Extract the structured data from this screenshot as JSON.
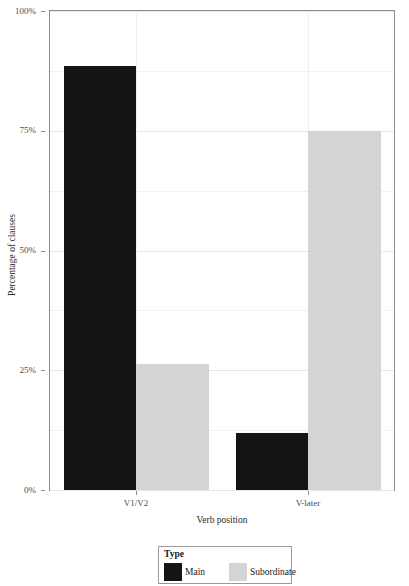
{
  "chart_data": {
    "type": "bar",
    "title": "",
    "subtitle": "",
    "xlabel": "Verb position",
    "ylabel": "Percentage of clauses",
    "categories": [
      "V1/V2",
      "V-later"
    ],
    "series": [
      {
        "name": "Main",
        "color": "#141414",
        "values": [
          88.5,
          11.9
        ]
      },
      {
        "name": "Subordinate",
        "color": "#d4d4d4",
        "values": [
          26.3,
          75.0
        ]
      }
    ],
    "ylim": [
      0,
      100
    ],
    "yticks": [
      0,
      25,
      50,
      75,
      100
    ],
    "ytick_labels": [
      "0%",
      "25%",
      "50%",
      "75%",
      "100%"
    ],
    "y_minor_ticks": [
      12.5,
      37.5,
      62.5,
      87.5
    ],
    "grid": true,
    "grid_axis": "both",
    "legend": {
      "title": "Type",
      "position": "bottom",
      "entries": [
        {
          "label": "Main",
          "color": "#141414"
        },
        {
          "label": "Subordinate",
          "color": "#d4d4d4"
        }
      ]
    },
    "panel": {
      "background": "#ffffff",
      "border_color": "#8c8c8c",
      "grid_major_color": "#e6e6e6",
      "grid_minor_color": "#f2f2f2"
    }
  }
}
